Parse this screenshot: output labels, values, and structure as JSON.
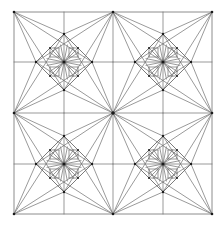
{
  "diagram": {
    "type": "geometric-crease-pattern",
    "colors": {
      "background": "#ffffff",
      "line": "#6e6e6e",
      "vertex": "#1a1a1a"
    },
    "frame": {
      "x1": 14,
      "y1": 12,
      "x2": 212,
      "y2": 214
    },
    "center": {
      "x": 113,
      "y": 113
    },
    "quadrants": [
      {
        "name": "top-left",
        "cx": 64,
        "cy": 62
      },
      {
        "name": "top-right",
        "cx": 163,
        "cy": 62
      },
      {
        "name": "bottom-left",
        "cx": 64,
        "cy": 164
      },
      {
        "name": "bottom-right",
        "cx": 163,
        "cy": 164
      }
    ],
    "geometry": {
      "half_quadrant": 50,
      "diamond_radius": 28,
      "inner_point_offset": 14,
      "small_square_half": 4.5
    }
  }
}
